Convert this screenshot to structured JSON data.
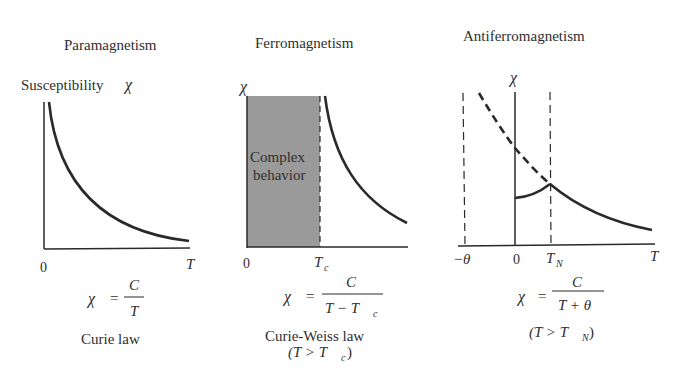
{
  "panels": [
    {
      "title": "Paramagnetism",
      "y_axis_label": "Susceptibility",
      "chi_symbol": "χ",
      "x_origin_label": "0",
      "x_axis_label": "T",
      "formula": {
        "lhs": "χ",
        "eq": "=",
        "numerator": "C",
        "denominator": "T"
      },
      "law_name": "Curie law"
    },
    {
      "title": "Ferromagnetism",
      "chi_symbol": "χ",
      "region_label_line1": "Complex",
      "region_label_line2": "behavior",
      "x_origin_label": "0",
      "critical_temp_label": "T",
      "critical_temp_sub": "c",
      "formula": {
        "lhs": "χ",
        "eq": "=",
        "numerator": "C",
        "denominator_main": "T − T",
        "denominator_sub": "c"
      },
      "law_name": "Curie-Weiss law",
      "condition_main": "(T > T",
      "condition_sub": "c",
      "condition_close": ")"
    },
    {
      "title": "Antiferromagnetism",
      "chi_symbol": "χ",
      "neg_theta_label": "−θ",
      "x_origin_label": "0",
      "neel_temp_label": "T",
      "neel_temp_sub": "N",
      "x_axis_label": "T",
      "formula": {
        "lhs": "χ",
        "eq": "=",
        "numerator": "C",
        "denominator": "T + θ"
      },
      "condition_main": "(T > T",
      "condition_sub": "N",
      "condition_close": ")"
    }
  ],
  "colors": {
    "ink": "#2a2a2a",
    "shaded_region": "#9a9a9a"
  }
}
